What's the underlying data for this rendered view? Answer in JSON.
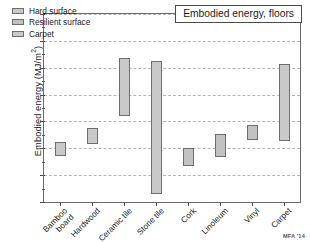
{
  "title": "Embodied energy, floors",
  "credit": "MFA '14",
  "axis": {
    "ylabel_main": "Embodied energy (MJ/m",
    "ylabel_sup": "2",
    "ylabel_close": ")",
    "ylabel_full": "Embodied energy (MJ/m²)",
    "yticks": [
      "0",
      "100",
      "200",
      "300",
      "400",
      "500",
      "600",
      "700"
    ]
  },
  "legend": {
    "items": [
      {
        "label": "Hard surface",
        "color": "#c9c9c9"
      },
      {
        "label": "Resilient surface",
        "color": "#c2c2c2"
      },
      {
        "label": "Carpet",
        "color": "#c9c9c9"
      }
    ]
  },
  "chart_data": {
    "type": "bar",
    "subtype": "floating-range-bar",
    "title": "Embodied energy, floors",
    "xlabel": "",
    "ylabel": "Embodied energy (MJ/m²)",
    "ylim": [
      0,
      700
    ],
    "ytick_step": 100,
    "yminor_step": 50,
    "grid": "horizontal-dashed",
    "legend_position": "top-left",
    "annotation": "MFA '14",
    "categories": [
      "Bamboo\nboard",
      "Hardwood",
      "Ceramic tile",
      "Stone tile",
      "Cork",
      "Linoleum",
      "Vinyl",
      "Carpet"
    ],
    "groups": [
      "Hard surface",
      "Hard surface",
      "Hard surface",
      "Hard surface",
      "Resilient surface",
      "Resilient surface",
      "Resilient surface",
      "Carpet"
    ],
    "low": [
      173,
      216,
      320,
      30,
      135,
      168,
      230,
      227
    ],
    "high": [
      222,
      277,
      535,
      525,
      200,
      255,
      288,
      512
    ],
    "bars": [
      {
        "category": "Bamboo board",
        "group": "Hard surface",
        "low": 173,
        "high": 222
      },
      {
        "category": "Hardwood",
        "group": "Hard surface",
        "low": 216,
        "high": 277
      },
      {
        "category": "Ceramic tile",
        "group": "Hard surface",
        "low": 320,
        "high": 535
      },
      {
        "category": "Stone tile",
        "group": "Hard surface",
        "low": 30,
        "high": 525
      },
      {
        "category": "Cork",
        "group": "Resilient surface",
        "low": 135,
        "high": 200
      },
      {
        "category": "Linoleum",
        "group": "Resilient surface",
        "low": 168,
        "high": 255
      },
      {
        "category": "Vinyl",
        "group": "Resilient surface",
        "low": 230,
        "high": 288
      },
      {
        "category": "Carpet",
        "group": "Carpet",
        "low": 227,
        "high": 512
      }
    ]
  }
}
